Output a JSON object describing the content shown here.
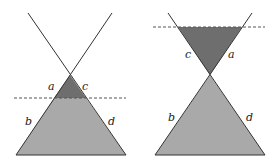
{
  "colors": {
    "background": "#ffffff",
    "light_fill": "#a9a9a9",
    "dark_fill": "#6e6e6e",
    "line": "#333333",
    "dashed": "#555555"
  },
  "figures": [
    {
      "name": "left-figure",
      "labels": {
        "a": "a",
        "b": "b",
        "c": "c",
        "d": "d"
      }
    },
    {
      "name": "right-figure",
      "labels": {
        "a": "a",
        "b": "b",
        "c": "c",
        "d": "d"
      }
    }
  ]
}
